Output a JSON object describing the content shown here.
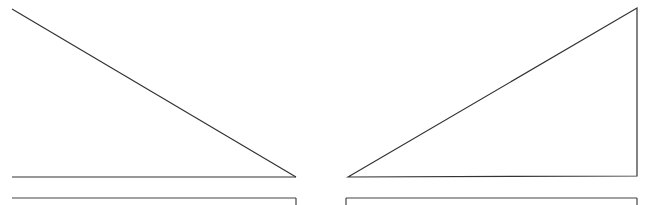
{
  "canvas": {
    "width": 654,
    "height": 205,
    "background": "#ffffff",
    "stroke": "#333333"
  },
  "shapes": {
    "left_triangle": {
      "diagonal": [
        [
          12,
          9
        ],
        [
          296,
          177
        ]
      ],
      "baseline": [
        [
          12,
          177
        ],
        [
          296,
          177
        ]
      ]
    },
    "right_triangle": {
      "points": [
        [
          348,
          177
        ],
        [
          637,
          8
        ],
        [
          637,
          176
        ]
      ]
    },
    "left_box": {
      "top": [
        [
          12,
          198
        ],
        [
          296,
          198
        ]
      ],
      "right_edge": [
        [
          296,
          198
        ],
        [
          296,
          205
        ]
      ]
    },
    "right_box": {
      "top": [
        [
          346,
          198
        ],
        [
          637,
          198
        ]
      ],
      "left_edge": [
        [
          346,
          198
        ],
        [
          346,
          205
        ]
      ],
      "right_edge": [
        [
          637,
          198
        ],
        [
          637,
          205
        ]
      ]
    }
  }
}
